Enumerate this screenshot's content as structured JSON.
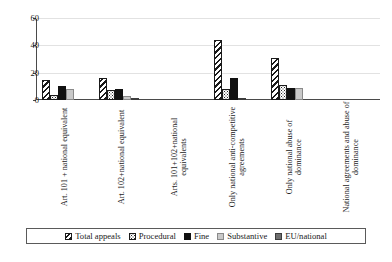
{
  "chart_data": {
    "type": "bar",
    "title": "",
    "subtitle": "",
    "xlabel": "",
    "ylabel": "",
    "ylim": [
      0,
      60
    ],
    "yticks": [
      0,
      20,
      40,
      60
    ],
    "grid": true,
    "legend_position": "bottom",
    "categories": [
      "Art. 101 + national equivalent",
      "Art. 102+national equivalent",
      "Arts. 101+102+national equivalents",
      "Only national anti-competitive agreements",
      "Only national abuse of dominance",
      "National agreements and abuse of dominance"
    ],
    "series": [
      {
        "name": "Total appeals",
        "values": [
          15,
          16,
          0,
          44,
          31,
          0
        ]
      },
      {
        "name": "Procedural",
        "values": [
          4,
          7,
          0,
          8,
          11,
          0
        ]
      },
      {
        "name": "Fine",
        "values": [
          10,
          8,
          0,
          16,
          9,
          0
        ]
      },
      {
        "name": "Substantive",
        "values": [
          8,
          3,
          0,
          0,
          9,
          0
        ]
      },
      {
        "name": "EU/national",
        "values": [
          0,
          1,
          0,
          1,
          0,
          0
        ]
      }
    ],
    "colors": {
      "total_appeals": "#1a1a1a",
      "procedural": "#2a2a2a",
      "fine": "#111111",
      "substantive": "#c9c9c9",
      "eu_national": "#6e6e6e",
      "gridline": "#e2e2e2",
      "axis": "#4a4a4a",
      "background": "#ffffff"
    }
  },
  "axis": {
    "y_tick_0": "0",
    "y_tick_20": "20",
    "y_tick_40": "40",
    "y_tick_60": "60"
  },
  "legend": {
    "items": [
      {
        "label": "Total appeals"
      },
      {
        "label": "Procedural"
      },
      {
        "label": "Fine"
      },
      {
        "label": "Substantive"
      },
      {
        "label": "EU/national"
      }
    ]
  }
}
